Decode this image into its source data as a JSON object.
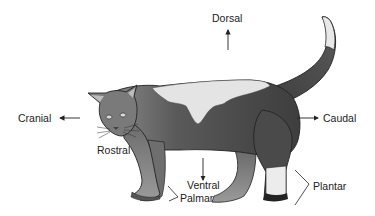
{
  "diagram": {
    "labels": {
      "dorsal": "Dorsal",
      "cranial": "Cranial",
      "caudal": "Caudal",
      "rostral": "Rostral",
      "ventral": "Ventral",
      "palmar": "Palmar",
      "plantar": "Plantar"
    },
    "arrows": [
      {
        "name": "dorsal-arrow",
        "direction": "up"
      },
      {
        "name": "cranial-arrow",
        "direction": "left"
      },
      {
        "name": "caudal-arrow",
        "direction": "right"
      },
      {
        "name": "ventral-arrow",
        "direction": "down"
      }
    ],
    "brackets": [
      {
        "name": "palmar-bracket",
        "target": "front paw"
      },
      {
        "name": "plantar-bracket",
        "target": "hind paw"
      }
    ],
    "colors": {
      "background": "#ffffff",
      "text": "#222222",
      "fur_dark": "#4a4a4a",
      "fur_mid": "#7a7a7a",
      "fur_light": "#e6e6e6",
      "outline": "#222222"
    }
  }
}
